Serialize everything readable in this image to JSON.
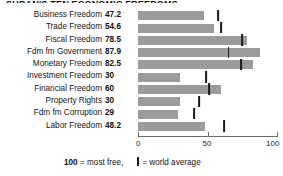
{
  "title_partial": "SUDAN'S TEN ECONOMIC FREEDOMS",
  "axis": {
    "min": 0,
    "max": 100,
    "ticks": [
      0,
      50,
      100
    ],
    "tick_labels": [
      "0",
      "50",
      "100"
    ]
  },
  "footnote": {
    "lead": "100",
    "mid": " = most free,",
    "tail": "= world average"
  },
  "chart_data": {
    "type": "bar",
    "orientation": "horizontal",
    "title": "SUDAN'S TEN ECONOMIC FREEDOMS",
    "xlabel": "",
    "ylabel": "",
    "xlim": [
      0,
      100
    ],
    "grid": false,
    "legend": "100 = most free,  | = world average",
    "categories": [
      "Business Freedom",
      "Trade Freedom",
      "Fiscal Freedom",
      "Fdm fm Government",
      "Monetary Freedom",
      "Investment Freedom",
      "Financial Freedom",
      "Property Rights",
      "Fdm fm Corruption",
      "Labor Freedom"
    ],
    "values": [
      47.2,
      54.6,
      78.5,
      87.9,
      82.5,
      30,
      60,
      30,
      29,
      48.2
    ],
    "value_labels": [
      "47.2",
      "54.6",
      "78.5",
      "87.9",
      "82.5",
      "30",
      "60",
      "30",
      "29",
      "48.2"
    ],
    "world_average": [
      57.5,
      60.0,
      74.9,
      65.2,
      73.9,
      49.0,
      51.0,
      44.0,
      40.5,
      62.0
    ],
    "series": [
      {
        "name": "Sudan score",
        "values": [
          47.2,
          54.6,
          78.5,
          87.9,
          82.5,
          30,
          60,
          30,
          29,
          48.2
        ]
      },
      {
        "name": "World average",
        "values": [
          57.5,
          60.0,
          74.9,
          65.2,
          73.9,
          49.0,
          51.0,
          44.0,
          40.5,
          62.0
        ]
      }
    ],
    "colors": {
      "bar": "#9b9b9b",
      "marker": "#1b1b1b",
      "axis": "#6d6d6d"
    }
  }
}
